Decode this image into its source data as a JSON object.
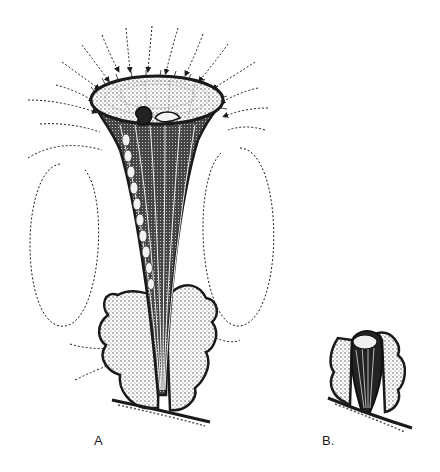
{
  "figure": {
    "panels": [
      {
        "id": "A",
        "label": "A",
        "content": "extended trumpet-shaped organism with ciliated oral disc, dotted current arrows converging on disc and looping eddies on both sides, attached among debris on substrate"
      },
      {
        "id": "B",
        "label": "B.",
        "content": "contracted organism inside a lorica/debris on substrate"
      }
    ],
    "colors": {
      "ink": "#1a1a1a",
      "background": "#ffffff",
      "stipple": "#3a3a3a"
    }
  }
}
